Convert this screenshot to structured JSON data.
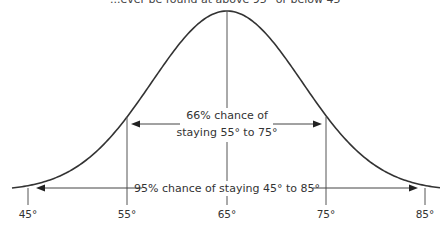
{
  "diagram": {
    "top_caption_partial": "...ever be found at above 95° or below 45°",
    "axis_labels": [
      "45°",
      "55°",
      "65°",
      "75°",
      "85°"
    ],
    "inner_annotation": {
      "line1": "66% chance of",
      "line2": "staying 55° to 75°"
    },
    "outer_annotation": "95% chance of staying 45° to 85°",
    "colors": {
      "curve": "#333333",
      "lines": "#555555",
      "text": "#333333",
      "background": "#ffffff"
    }
  },
  "chart_data": {
    "type": "line",
    "xlabel": "Temperature (°F)",
    "ylabel": "",
    "x_ticks": [
      "45°",
      "55°",
      "65°",
      "75°",
      "85°"
    ],
    "mean": 65,
    "std_dev": 10,
    "annotations": [
      {
        "range": [
          55,
          75
        ],
        "text": "66% chance of staying 55° to 75°"
      },
      {
        "range": [
          45,
          85
        ],
        "text": "95% chance of staying 45° to 85°"
      }
    ],
    "grid": false
  }
}
